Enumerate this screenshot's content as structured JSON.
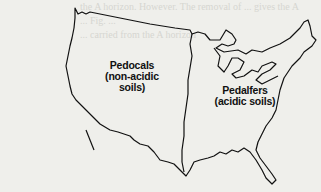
{
  "figure": {
    "type": "map",
    "regions": [
      {
        "name": "Pedocals",
        "description": "(non-acidic soils)",
        "area": "west"
      },
      {
        "name": "Pedalfers",
        "description": "(acidic soils)",
        "area": "east"
      }
    ],
    "line_color": "#111111",
    "background_color": "#efefeb"
  },
  "bleed_through_text": [
    "the A horizon. However. The removal of ... gives the A",
    "... Fig. ... ",
    "... carried from the A horizon",
    "... Pedocals ... are found ... to the",
    "... on ... tables ... in moist tropical"
  ]
}
